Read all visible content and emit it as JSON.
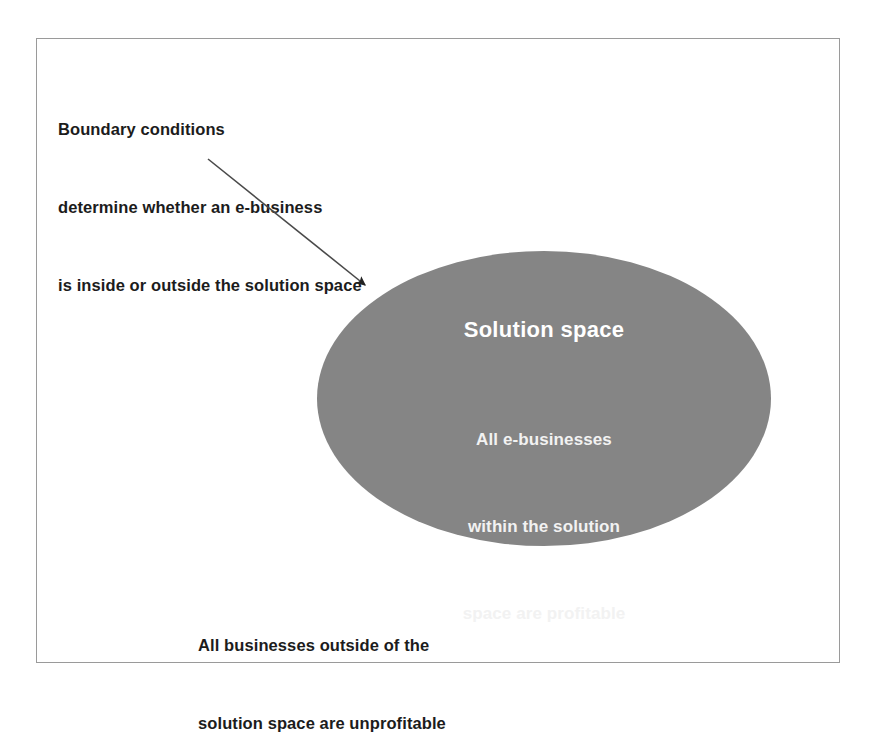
{
  "figure": {
    "background_color": "#ffffff",
    "border_color": "#9a9a9a"
  },
  "callout": {
    "lines": [
      "Boundary conditions",
      "determine whether an e-business",
      "is inside or outside the solution space"
    ]
  },
  "arrow": {
    "name": "callout-arrow",
    "from_x": 207,
    "from_y": 158,
    "to_x": 368,
    "to_y": 287,
    "color": "#333333"
  },
  "ellipse": {
    "fill_color": "#858585",
    "text_color": "#ffffff",
    "title": "Solution space",
    "body_lines": [
      "All e-businesses",
      "within the solution",
      "space are profitable"
    ]
  },
  "outside_note": {
    "lines": [
      "All businesses outside of the",
      "solution space are unprofitable"
    ]
  }
}
